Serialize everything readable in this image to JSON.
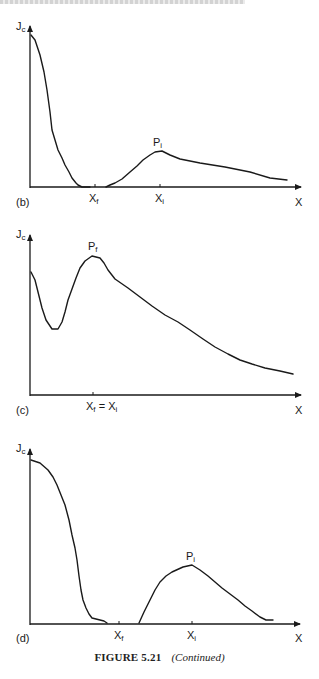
{
  "figure": {
    "caption_label": "FIGURE 5.21",
    "caption_note": "(Continued)"
  },
  "chart_data": [
    {
      "type": "line",
      "panel": "(b)",
      "title": "",
      "ylabel": "J",
      "ylabel_sub": "c",
      "xlabel": "X",
      "grid": false,
      "legend": null,
      "x_ticks": [
        {
          "label": "X",
          "sub": "f",
          "pos": 95
        },
        {
          "label": "X",
          "sub": "i",
          "pos": 160
        }
      ],
      "annotations": [
        {
          "text": "P",
          "sub": "i",
          "at": [
            160,
            152
          ]
        }
      ],
      "axis_px": {
        "x0": 30,
        "x1": 303,
        "y_axis_top": 24,
        "y_base": 187
      },
      "segments": [
        [
          [
            31,
            35
          ],
          [
            35,
            40
          ],
          [
            40,
            55
          ],
          [
            44,
            72
          ],
          [
            47,
            90
          ],
          [
            50,
            112
          ],
          [
            52,
            130
          ],
          [
            55,
            140
          ],
          [
            58,
            150
          ],
          [
            62,
            158
          ],
          [
            65,
            165
          ],
          [
            69,
            172
          ],
          [
            72,
            178
          ],
          [
            76,
            183
          ],
          [
            78,
            185
          ],
          [
            82,
            187
          ],
          [
            90,
            187
          ]
        ],
        [
          [
            106,
            187
          ],
          [
            110,
            185
          ],
          [
            115,
            183
          ],
          [
            122,
            179
          ],
          [
            130,
            172
          ],
          [
            137,
            166
          ],
          [
            143,
            160
          ],
          [
            150,
            155
          ],
          [
            155,
            152
          ],
          [
            162,
            151
          ],
          [
            170,
            155
          ],
          [
            180,
            159
          ],
          [
            200,
            163
          ],
          [
            225,
            167
          ],
          [
            250,
            172
          ],
          [
            270,
            178
          ],
          [
            287,
            180
          ]
        ]
      ]
    },
    {
      "type": "line",
      "panel": "(c)",
      "title": "",
      "ylabel": "J",
      "ylabel_sub": "c",
      "xlabel": "X",
      "grid": false,
      "legend": null,
      "x_ticks": [
        {
          "label": "X",
          "sub": "f",
          "label2": " = X",
          "sub2": "i",
          "pos": 93
        }
      ],
      "annotations": [
        {
          "text": "P",
          "sub": "f",
          "at": [
            93,
            256
          ]
        }
      ],
      "axis_px": {
        "x0": 30,
        "x1": 303,
        "y_axis_top": 233,
        "y_base": 395
      },
      "segments": [
        [
          [
            31,
            272
          ],
          [
            35,
            280
          ],
          [
            38,
            292
          ],
          [
            42,
            308
          ],
          [
            46,
            320
          ],
          [
            52,
            329
          ],
          [
            58,
            329
          ],
          [
            62,
            322
          ],
          [
            65,
            312
          ],
          [
            68,
            300
          ],
          [
            72,
            289
          ],
          [
            76,
            278
          ],
          [
            80,
            268
          ],
          [
            85,
            261
          ],
          [
            92,
            256
          ],
          [
            100,
            258
          ],
          [
            104,
            263
          ],
          [
            108,
            270
          ],
          [
            115,
            279
          ],
          [
            128,
            288
          ],
          [
            140,
            297
          ],
          [
            152,
            306
          ],
          [
            165,
            315
          ],
          [
            178,
            322
          ],
          [
            190,
            330
          ],
          [
            203,
            339
          ],
          [
            215,
            347
          ],
          [
            228,
            354
          ],
          [
            240,
            360
          ],
          [
            252,
            364
          ],
          [
            265,
            368
          ],
          [
            280,
            371
          ],
          [
            293,
            374
          ]
        ]
      ]
    },
    {
      "type": "line",
      "panel": "(d)",
      "title": "",
      "ylabel": "J",
      "ylabel_sub": "c",
      "xlabel": "X",
      "grid": false,
      "legend": null,
      "x_ticks": [
        {
          "label": "X",
          "sub": "f",
          "pos": 119
        },
        {
          "label": "X",
          "sub": "i",
          "pos": 192
        }
      ],
      "annotations": [
        {
          "text": "P",
          "sub": "i",
          "at": [
            192,
            565
          ]
        }
      ],
      "axis_px": {
        "x0": 30,
        "x1": 302,
        "y_axis_top": 447,
        "y_base": 624
      },
      "segments": [
        [
          [
            31,
            460
          ],
          [
            40,
            463
          ],
          [
            48,
            470
          ],
          [
            53,
            477
          ],
          [
            57,
            485
          ],
          [
            61,
            495
          ],
          [
            65,
            505
          ],
          [
            69,
            520
          ],
          [
            72,
            535
          ],
          [
            75,
            548
          ],
          [
            77,
            560
          ],
          [
            79,
            576
          ],
          [
            81,
            590
          ],
          [
            83,
            600
          ],
          [
            86,
            608
          ],
          [
            89,
            614
          ],
          [
            92,
            618
          ],
          [
            100,
            620
          ],
          [
            104,
            621
          ],
          [
            107,
            623
          ]
        ],
        [
          [
            139,
            623
          ],
          [
            144,
            612
          ],
          [
            150,
            600
          ],
          [
            155,
            590
          ],
          [
            160,
            582
          ],
          [
            166,
            576
          ],
          [
            172,
            572
          ],
          [
            183,
            567
          ],
          [
            192,
            565
          ],
          [
            200,
            570
          ],
          [
            208,
            576
          ],
          [
            215,
            582
          ],
          [
            222,
            588
          ],
          [
            230,
            594
          ],
          [
            238,
            600
          ],
          [
            245,
            606
          ],
          [
            252,
            611
          ],
          [
            260,
            617
          ],
          [
            266,
            620
          ],
          [
            273,
            620
          ]
        ]
      ]
    }
  ],
  "labels": {
    "panel_b": "(b)",
    "panel_c": "(c)",
    "panel_d": "(d)",
    "y_main": "J",
    "y_sub": "c",
    "x_axis": "X",
    "tick_main": "X",
    "sub_f": "f",
    "sub_i": "i",
    "peak_main": "P",
    "eq": " = "
  }
}
